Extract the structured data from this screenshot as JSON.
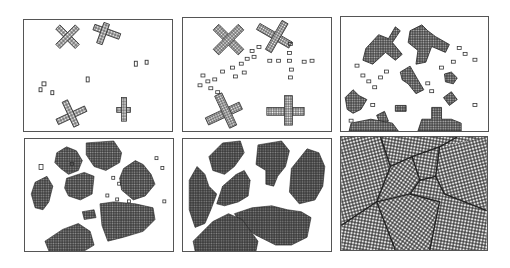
{
  "figure": {
    "stroke_color": "#333333",
    "border_color": "#555555",
    "background": "#ffffff"
  },
  "panels": [
    {
      "id": 1,
      "label": "",
      "stage": "nucleation - sparse crosses and isolated seeds"
    },
    {
      "id": 2,
      "label": "",
      "stage": "early growth - crosses thickening, seed chains"
    },
    {
      "id": 3,
      "label": "",
      "stage": "growth - many branched crystallites and seeds"
    },
    {
      "id": 4,
      "label": "",
      "stage": "coarsening - grains thickening into blobs"
    },
    {
      "id": 5,
      "label": "",
      "stage": "impingement - grains nearly touching"
    },
    {
      "id": 6,
      "label": "",
      "stage": "complete - space-filling polycrystal with grain boundaries"
    }
  ]
}
